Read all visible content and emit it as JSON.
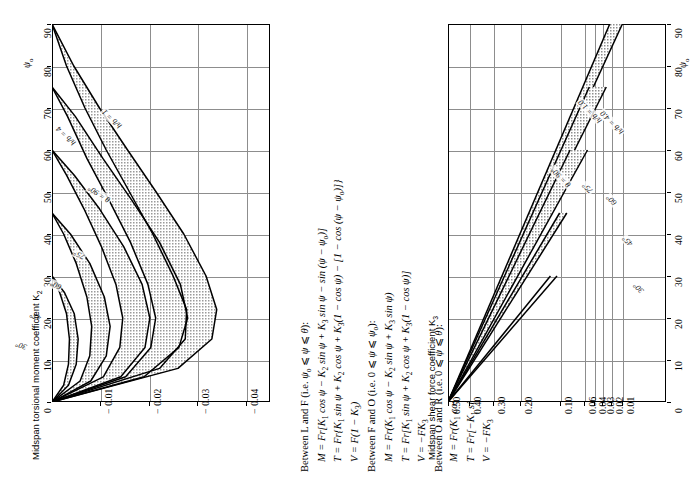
{
  "figure": {
    "orientation": "rotated-90-ccw",
    "panels": [
      "torsional-moment-chart",
      "shear-force-chart"
    ]
  },
  "left_chart": {
    "axis_title": "Midspan torsional moment coefficient K",
    "axis_title_sub": "2",
    "psi_symbol": "ψ",
    "psi_sub": "o",
    "curve_labels": [
      {
        "text": "h/b = 1",
        "x": 118,
        "y": 131,
        "rot": -46
      },
      {
        "text": "h/b = 4",
        "x": 72,
        "y": 148,
        "rot": -46
      },
      {
        "text": "θ = 90°",
        "x": 108,
        "y": 205,
        "rot": -58
      },
      {
        "text": "75°",
        "x": 83,
        "y": 262,
        "rot": -62
      },
      {
        "text": "60°",
        "x": 60,
        "y": 292,
        "rot": -66
      },
      {
        "text": "45°",
        "x": 40,
        "y": 323,
        "rot": -70
      },
      {
        "text": "30°",
        "x": 26,
        "y": 352,
        "rot": -72
      }
    ]
  },
  "right_chart": {
    "axis_title": "Midspan shear force coefficient K",
    "axis_title_sub": "3",
    "psi_symbol": "ψ",
    "psi_sub": "o",
    "curve_labels": [
      {
        "text": "h/b = 1.0",
        "x": 598,
        "y": 126,
        "rot": -45
      },
      {
        "text": "h/b = 4.0",
        "x": 620,
        "y": 137,
        "rot": -45
      },
      {
        "text": "θ = 90°",
        "x": 567,
        "y": 190,
        "rot": -45
      },
      {
        "text": "75°",
        "x": 589,
        "y": 196,
        "rot": -45
      },
      {
        "text": "60°",
        "x": 613,
        "y": 208,
        "rot": -45
      },
      {
        "text": "45°",
        "x": 629,
        "y": 249,
        "rot": -45
      },
      {
        "text": "30°",
        "x": 640,
        "y": 296,
        "rot": -45
      }
    ]
  },
  "chart_data": [
    {
      "type": "line",
      "id": "torsional-moment",
      "title": "Midspan torsional moment coefficient K2",
      "xlabel": "Midspan torsional moment coefficient K2",
      "ylabel": "ψo",
      "xlim": [
        0,
        -0.045
      ],
      "ylim": [
        0,
        90
      ],
      "xticks": [
        -0.01,
        -0.02,
        -0.03,
        -0.04
      ],
      "xticklabels": [
        "− 0.01",
        "− 0.02",
        "− 0.03",
        "− 0.04"
      ],
      "yticks": [
        0,
        10,
        20,
        30,
        40,
        50,
        60,
        70,
        80,
        90
      ],
      "yticklabels": [
        "0",
        "10",
        "20",
        "30",
        "40",
        "50",
        "60",
        "70",
        "80",
        "90"
      ],
      "grid": true,
      "legend": "inline-curve-labels",
      "note": "Each theta band is bounded by h/b = 1 (upper) and h/b = 4 (lower); band interiors are stippled grey.",
      "series": [
        {
          "name": "θ = 90°, h/b = 1",
          "points": [
            [
              0,
              90
            ],
            [
              -0.0045,
              80
            ],
            [
              -0.0098,
              70
            ],
            [
              -0.0156,
              60
            ],
            [
              -0.0215,
              50
            ],
            [
              -0.0272,
              40
            ],
            [
              -0.0318,
              30
            ],
            [
              -0.034,
              22
            ],
            [
              -0.033,
              15
            ],
            [
              -0.026,
              8
            ],
            [
              0,
              0
            ]
          ]
        },
        {
          "name": "θ = 90°, h/b = 4",
          "points": [
            [
              0,
              90
            ],
            [
              -0.003,
              80
            ],
            [
              -0.0068,
              70
            ],
            [
              -0.0112,
              60
            ],
            [
              -0.016,
              50
            ],
            [
              -0.0208,
              40
            ],
            [
              -0.025,
              30
            ],
            [
              -0.0278,
              22
            ],
            [
              -0.0275,
              15
            ],
            [
              -0.0222,
              8
            ],
            [
              0,
              0
            ]
          ]
        },
        {
          "name": "θ = 75°, h/b = 1",
          "points": [
            [
              0,
              75
            ],
            [
              -0.0048,
              68
            ],
            [
              -0.0105,
              58
            ],
            [
              -0.0165,
              48
            ],
            [
              -0.0222,
              38
            ],
            [
              -0.0265,
              28
            ],
            [
              -0.028,
              20
            ],
            [
              -0.0262,
              13
            ],
            [
              -0.019,
              6
            ],
            [
              0,
              0
            ]
          ]
        },
        {
          "name": "θ = 75°, h/b = 4",
          "points": [
            [
              0,
              75
            ],
            [
              -0.0032,
              68
            ],
            [
              -0.0072,
              58
            ],
            [
              -0.0118,
              48
            ],
            [
              -0.0162,
              38
            ],
            [
              -0.0198,
              28
            ],
            [
              -0.0214,
              20
            ],
            [
              -0.0204,
              13
            ],
            [
              -0.0152,
              6
            ],
            [
              0,
              0
            ]
          ]
        },
        {
          "name": "θ = 60°, h/b = 1",
          "points": [
            [
              0,
              60
            ],
            [
              -0.0046,
              54
            ],
            [
              -0.0098,
              46
            ],
            [
              -0.0148,
              37
            ],
            [
              -0.0186,
              28
            ],
            [
              -0.0202,
              20
            ],
            [
              -0.0192,
              13
            ],
            [
              -0.0142,
              6
            ],
            [
              0,
              0
            ]
          ]
        },
        {
          "name": "θ = 60°, h/b = 4",
          "points": [
            [
              0,
              60
            ],
            [
              -0.003,
              54
            ],
            [
              -0.0066,
              46
            ],
            [
              -0.0102,
              37
            ],
            [
              -0.0132,
              28
            ],
            [
              -0.0146,
              20
            ],
            [
              -0.014,
              13
            ],
            [
              -0.0106,
              6
            ],
            [
              0,
              0
            ]
          ]
        },
        {
          "name": "θ = 45°, h/b = 1",
          "points": [
            [
              0,
              45
            ],
            [
              -0.0038,
              40
            ],
            [
              -0.0078,
              33
            ],
            [
              -0.0108,
              25
            ],
            [
              -0.012,
              18
            ],
            [
              -0.0112,
              11
            ],
            [
              -0.008,
              5
            ],
            [
              0,
              0
            ]
          ]
        },
        {
          "name": "θ = 45°, h/b = 4",
          "points": [
            [
              0,
              45
            ],
            [
              -0.0024,
              40
            ],
            [
              -0.005,
              33
            ],
            [
              -0.0072,
              25
            ],
            [
              -0.0082,
              18
            ],
            [
              -0.0078,
              11
            ],
            [
              -0.0058,
              5
            ],
            [
              0,
              0
            ]
          ]
        },
        {
          "name": "θ = 30°, h/b = 1",
          "points": [
            [
              0,
              30
            ],
            [
              -0.0026,
              26
            ],
            [
              -0.0046,
              21
            ],
            [
              -0.0054,
              15
            ],
            [
              -0.005,
              9
            ],
            [
              -0.0034,
              4
            ],
            [
              0,
              0
            ]
          ]
        },
        {
          "name": "θ = 30°, h/b = 4",
          "points": [
            [
              0,
              30
            ],
            [
              -0.0016,
              26
            ],
            [
              -0.003,
              21
            ],
            [
              -0.0036,
              15
            ],
            [
              -0.0034,
              9
            ],
            [
              -0.0024,
              4
            ],
            [
              0,
              0
            ]
          ]
        }
      ]
    },
    {
      "type": "line",
      "id": "shear-force",
      "title": "Midspan shear force coefficient K3",
      "xlabel": "Midspan shear force coefficient K3",
      "ylabel": "ψo",
      "x_scale": "non-uniform (reversed, compressed toward small values)",
      "xticks": [
        0.5,
        0.4,
        0.3,
        0.2,
        0.1,
        0.06,
        0.04,
        0.03,
        0.02,
        0.01
      ],
      "xticklabels": [
        "0.50",
        "0.40",
        "0.30",
        "0.20",
        "0.10",
        "0.06",
        "0.04",
        "0.03",
        "0.02",
        "0.01"
      ],
      "yticks": [
        0,
        10,
        20,
        30,
        40,
        50,
        60,
        70,
        80,
        90
      ],
      "yticklabels": [
        "0",
        "10",
        "20",
        "30",
        "40",
        "50",
        "60",
        "70",
        "80",
        "90"
      ],
      "ylim": [
        0,
        90
      ],
      "grid": true,
      "note": "All curves radiate from K3 = 0.50 at ψo = 0; each theta band bounded by h/b = 1.0 and h/b = 4.0.",
      "series": [
        {
          "name": "θ = 90°, h/b = 1.0",
          "endpoint_psi": 90
        },
        {
          "name": "θ = 90°, h/b = 4.0",
          "endpoint_psi": 90
        },
        {
          "name": "θ = 75°, h/b = 1.0",
          "endpoint_psi": 75
        },
        {
          "name": "θ = 75°, h/b = 4.0",
          "endpoint_psi": 75
        },
        {
          "name": "θ = 60°, h/b = 1.0",
          "endpoint_psi": 60
        },
        {
          "name": "θ = 60°, h/b = 4.0",
          "endpoint_psi": 60
        },
        {
          "name": "θ = 45°",
          "endpoint_psi": 45
        },
        {
          "name": "θ = 30°",
          "endpoint_psi": 30
        }
      ]
    }
  ],
  "formulas": {
    "groups": [
      {
        "heading_html": "Between L and F (i.e. <span class=\"it\">ψ</span><sub>o</sub> ⩽ <span class=\"it\">ψ</span> ⩽ <span class=\"it\">θ</span>):",
        "equations_html": [
          "M = Fr[K<sub>1</sub> cos ψ − K<sub>2</sub> sin ψ + K<sub>3</sub> sin ψ − sin (ψ − ψ<sub>o</sub>)]",
          "T = Fr{K<sub>1</sub> sin ψ + K<sub>2</sub> cos ψ + K<sub>3</sub>(1 − cos ψ) − [1 − cos (ψ − ψ<sub>o</sub>)]}",
          "V = F(1 − K<sub>3</sub>)"
        ]
      },
      {
        "heading_html": "Between F and O (i.e. 0 ⩽ <span class=\"it\">ψ</span> ⩽ <span class=\"it\">ψ</span><sub>o</sub>):",
        "equations_html": [
          "M = Fr(K<sub>1</sub> cos ψ − K<sub>2</sub> sin ψ + K<sub>3</sub> sin ψ)",
          "T = Fr[K<sub>1</sub> sin ψ + K<sub>2</sub> cos ψ + K<sub>3</sub>(1 − cos ψ)]",
          "V = −FK<sub>3</sub>"
        ]
      },
      {
        "heading_html": "Between O and R (i.e. 0 ⩽ <span class=\"it\">ψ</span> ⩽ <span class=\"it\">θ</span>):",
        "equations_html": [
          "M = Fr(K<sub>1</sub> cos ψ + K<sub>2</sub> sin ψ − K<sub>3</sub> sin ψ)",
          "T = Fr[−K<sub>1</sub> sin ψ + K<sub>2</sub> cos ψ + K<sub>3</sub>(1 − cos ψ)]",
          "V = −FK<sub>3</sub>"
        ]
      }
    ]
  }
}
